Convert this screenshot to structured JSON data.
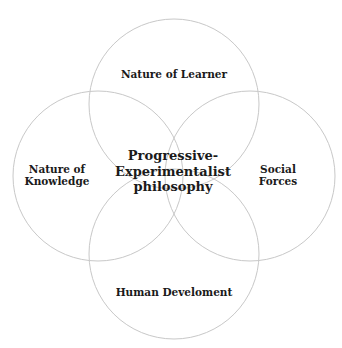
{
  "diagram": {
    "type": "venn-four-circle",
    "center_label": "Progressive-\nExperimentalist\nphilosophy",
    "circles": [
      {
        "id": "top",
        "label": "Nature of Learner",
        "cx": 174,
        "cy": 104,
        "r": 85
      },
      {
        "id": "left",
        "label": "Nature of\nKnowledge",
        "cx": 98,
        "cy": 176,
        "r": 85
      },
      {
        "id": "right",
        "label": "Social\nForces",
        "cx": 250,
        "cy": 176,
        "r": 85
      },
      {
        "id": "bottom",
        "label": "Human Develoment",
        "cx": 174,
        "cy": 254,
        "r": 85
      }
    ],
    "stroke_color": "#c8c8c8",
    "text_color": "#1a1a1a",
    "background": "#ffffff"
  }
}
